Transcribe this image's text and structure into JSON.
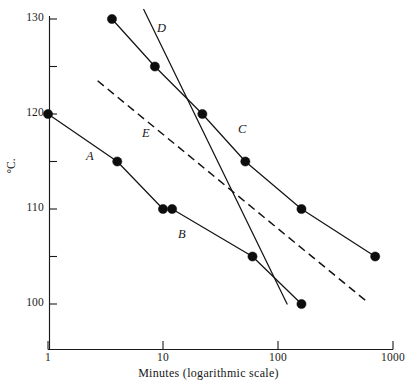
{
  "chart_data": {
    "type": "line",
    "title": "",
    "xlabel": "Minutes (logarithmic scale)",
    "ylabel": "°C.",
    "xscale": "log",
    "xlim": [
      1,
      1000
    ],
    "ylim": [
      97.5,
      131.5
    ],
    "grid": false,
    "legend": "inline-curve-labels",
    "x_ticks": [
      {
        "value": 1,
        "label": "1"
      },
      {
        "value": 10,
        "label": "10"
      },
      {
        "value": 100,
        "label": "100"
      },
      {
        "value": 1000,
        "label": "1000"
      }
    ],
    "y_ticks": [
      {
        "value": 130,
        "label": "130"
      },
      {
        "value": 125,
        "label": ""
      },
      {
        "value": 120,
        "label": "120"
      },
      {
        "value": 115,
        "label": ""
      },
      {
        "value": 110,
        "label": "110"
      },
      {
        "value": 105,
        "label": ""
      },
      {
        "value": 100,
        "label": "100"
      }
    ],
    "series": [
      {
        "name": "A",
        "label": "A",
        "style": "solid-with-markers",
        "points": [
          {
            "x": 1,
            "y": 120
          },
          {
            "x": 4,
            "y": 115
          },
          {
            "x": 10,
            "y": 110
          }
        ]
      },
      {
        "name": "B",
        "label": "B",
        "style": "solid-with-markers",
        "points": [
          {
            "x": 12,
            "y": 110
          },
          {
            "x": 60,
            "y": 105
          },
          {
            "x": 160,
            "y": 100
          }
        ]
      },
      {
        "name": "C",
        "label": "C",
        "style": "solid-with-markers",
        "points": [
          {
            "x": 3.6,
            "y": 130
          },
          {
            "x": 8.5,
            "y": 125
          },
          {
            "x": 22,
            "y": 120
          },
          {
            "x": 52,
            "y": 115
          },
          {
            "x": 160,
            "y": 110
          },
          {
            "x": 700,
            "y": 105
          }
        ]
      },
      {
        "name": "D",
        "label": "D",
        "style": "solid-no-markers",
        "points": [
          {
            "x": 6.8,
            "y": 131
          },
          {
            "x": 120,
            "y": 100
          }
        ]
      },
      {
        "name": "E",
        "label": "E",
        "style": "dashed-no-markers",
        "points": [
          {
            "x": 2.7,
            "y": 123.5
          },
          {
            "x": 600,
            "y": 100.2
          }
        ]
      }
    ],
    "series_label_positions": [
      {
        "name": "A",
        "x": 86,
        "y": 149
      },
      {
        "name": "B",
        "x": 178,
        "y": 227
      },
      {
        "name": "C",
        "x": 238,
        "y": 122
      },
      {
        "name": "D",
        "x": 157,
        "y": 21
      },
      {
        "name": "E",
        "x": 142,
        "y": 126
      }
    ]
  }
}
